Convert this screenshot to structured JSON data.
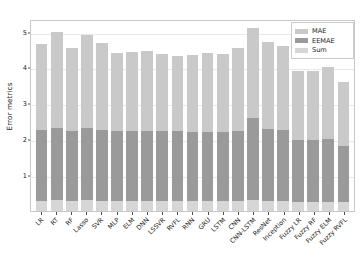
{
  "chart_data": {
    "type": "bar",
    "title": "",
    "subtitle": "",
    "xlabel": "",
    "ylabel": "Error metrics",
    "ylim": [
      0,
      5.35
    ],
    "yticks": [
      1,
      2,
      3,
      4,
      5
    ],
    "ytick_labels": [
      "1",
      "2",
      "3",
      "4",
      "5"
    ],
    "grid": true,
    "stacked": true,
    "legend_position": "upper right",
    "categories": [
      "LR",
      "RT",
      "RF",
      "Lasso",
      "SVR",
      "MLP",
      "ELM",
      "DNN",
      "LSSVR",
      "RVFL",
      "RNN",
      "GRU",
      "LSTM",
      "CNN",
      "CNN-LSTM",
      "ResNet",
      "Inception",
      "Fuzzy LR",
      "Fuzzy RF",
      "Fuzzy ELM",
      "Fuzzy RVFL"
    ],
    "series": [
      {
        "name": "Sum",
        "color": "#d6d6d6",
        "values": [
          0.28,
          0.3,
          0.28,
          0.3,
          0.28,
          0.28,
          0.28,
          0.28,
          0.28,
          0.28,
          0.28,
          0.28,
          0.28,
          0.28,
          0.3,
          0.28,
          0.28,
          0.26,
          0.26,
          0.26,
          0.24
        ]
      },
      {
        "name": "EEMAE",
        "color": "#9a9a9a",
        "values": [
          1.97,
          2.0,
          1.95,
          2.0,
          1.97,
          1.95,
          1.95,
          1.95,
          1.95,
          1.95,
          1.92,
          1.92,
          1.92,
          1.95,
          2.3,
          2.0,
          1.97,
          1.72,
          1.72,
          1.74,
          1.56
        ]
      },
      {
        "name": "MAE",
        "color": "#c9c9c9",
        "values": [
          2.4,
          2.7,
          2.32,
          2.6,
          2.42,
          2.17,
          2.2,
          2.22,
          2.15,
          2.1,
          2.15,
          2.2,
          2.18,
          2.3,
          2.5,
          2.42,
          2.35,
          1.92,
          1.92,
          2.0,
          1.8
        ]
      }
    ],
    "totals": [
      4.65,
      5.0,
      4.55,
      4.9,
      4.67,
      4.4,
      4.43,
      4.45,
      4.38,
      4.33,
      4.35,
      4.4,
      4.38,
      4.53,
      5.1,
      4.7,
      4.6,
      3.9,
      3.9,
      4.0,
      3.6
    ]
  },
  "legend": {
    "items": [
      {
        "label": "MAE",
        "color": "#c9c9c9"
      },
      {
        "label": "EEMAE",
        "color": "#9a9a9a"
      },
      {
        "label": "Sum",
        "color": "#d6d6d6"
      }
    ]
  },
  "colors": {
    "mae": "#c9c9c9",
    "eemae": "#9a9a9a",
    "sum": "#d6d6d6",
    "axis": "#4d4d4d",
    "frame": "#c8c8c8",
    "grid": "#e8e8e8",
    "text": "#1a1a1a",
    "background": "#ffffff"
  }
}
